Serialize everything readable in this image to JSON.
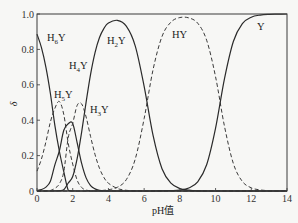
{
  "chart_data": {
    "type": "line",
    "title": "",
    "xlabel": "pH值",
    "ylabel": "δ",
    "xlim": [
      0,
      14
    ],
    "ylim": [
      0,
      1.0
    ],
    "grid": false,
    "legend": "inline labels on curves",
    "x_ticks": [
      "0",
      "2",
      "4",
      "6",
      "8",
      "10",
      "12",
      "14"
    ],
    "y_ticks": [
      "0",
      "0.2",
      "0.4",
      "0.6",
      "0.8",
      "1.0"
    ],
    "x": [
      0,
      0.25,
      0.5,
      0.75,
      1,
      1.25,
      1.5,
      1.75,
      2,
      2.25,
      2.5,
      2.75,
      3,
      3.25,
      3.5,
      3.75,
      4,
      4.5,
      5,
      5.5,
      6,
      6.5,
      7,
      7.5,
      8,
      8.5,
      9,
      9.5,
      10,
      10.5,
      11,
      11.5,
      12,
      12.5,
      13,
      13.5,
      14
    ],
    "series": [
      {
        "name": "H6Y",
        "label_main": "H",
        "label_sub": "6",
        "label_tail": "Y",
        "style": "solid",
        "label_pos": [
          47,
          41
        ],
        "values": [
          0.886,
          0.81,
          0.699,
          0.551,
          0.371,
          0.226,
          0.109,
          0.004,
          0.001,
          0,
          0,
          0,
          0,
          0,
          0,
          0,
          0,
          0,
          0,
          0,
          0,
          0,
          0,
          0,
          0,
          0,
          0,
          0,
          0,
          0,
          0,
          0,
          0,
          0,
          0,
          0,
          0
        ]
      },
      {
        "name": "H5Y",
        "label_main": "H",
        "label_sub": "5",
        "label_tail": "Y",
        "style": "dashed",
        "label_pos": [
          54,
          98
        ],
        "values": [
          0.112,
          0.181,
          0.278,
          0.39,
          0.467,
          0.506,
          0.432,
          0.269,
          0.152,
          0.061,
          0.02,
          0.005,
          0.002,
          0,
          0,
          0,
          0,
          0,
          0,
          0,
          0,
          0,
          0,
          0,
          0,
          0,
          0,
          0,
          0,
          0,
          0,
          0,
          0,
          0,
          0,
          0,
          0
        ]
      },
      {
        "name": "H4Y",
        "label_main": "H",
        "label_sub": "4",
        "label_tail": "Y",
        "style": "solid",
        "label_pos": [
          69,
          69
        ],
        "values": [
          0.003,
          0.008,
          0.022,
          0.055,
          0.148,
          0.226,
          0.343,
          0.38,
          0.382,
          0.272,
          0.156,
          0.074,
          0.031,
          0.012,
          0.004,
          0.001,
          0,
          0,
          0,
          0,
          0,
          0,
          0,
          0,
          0,
          0,
          0,
          0,
          0,
          0,
          0,
          0,
          0,
          0,
          0,
          0,
          0
        ]
      },
      {
        "name": "H3Y",
        "label_main": "H",
        "label_sub": "3",
        "label_tail": "Y",
        "style": "dashed",
        "label_pos": [
          90,
          113
        ],
        "values": [
          0,
          0,
          0.001,
          0.003,
          0.015,
          0.04,
          0.109,
          0.302,
          0.382,
          0.484,
          0.492,
          0.418,
          0.308,
          0.206,
          0.128,
          0.076,
          0.044,
          0.014,
          0.004,
          0.001,
          0,
          0,
          0,
          0,
          0,
          0,
          0,
          0,
          0,
          0,
          0,
          0,
          0,
          0,
          0,
          0,
          0
        ]
      },
      {
        "name": "H2Y",
        "label_main": "H",
        "label_sub": "2",
        "label_tail": "Y",
        "style": "solid",
        "label_pos": [
          107,
          44
        ],
        "values": [
          0,
          0,
          0,
          0,
          0.001,
          0.002,
          0.007,
          0.045,
          0.082,
          0.184,
          0.333,
          0.502,
          0.659,
          0.782,
          0.867,
          0.919,
          0.949,
          0.964,
          0.931,
          0.82,
          0.591,
          0.314,
          0.126,
          0.044,
          0.014,
          0.005,
          0.001,
          0,
          0,
          0,
          0,
          0,
          0,
          0,
          0,
          0,
          0
        ]
      },
      {
        "name": "HY",
        "label_main": "HY",
        "label_sub": "",
        "label_tail": "",
        "style": "dashed",
        "label_pos": [
          172,
          38
        ],
        "values": [
          0,
          0,
          0,
          0,
          0,
          0,
          0,
          0,
          0,
          0,
          0,
          0,
          0,
          0,
          0.001,
          0.004,
          0.007,
          0.021,
          0.064,
          0.18,
          0.409,
          0.686,
          0.873,
          0.954,
          0.98,
          0.978,
          0.948,
          0.852,
          0.645,
          0.365,
          0.154,
          0.054,
          0.018,
          0.006,
          0.002,
          0.001,
          0
        ]
      },
      {
        "name": "Y",
        "label_main": "Y",
        "label_sub": "",
        "label_tail": "",
        "style": "solid",
        "label_pos": [
          257,
          30
        ],
        "values": [
          0,
          0,
          0,
          0,
          0,
          0,
          0,
          0,
          0,
          0,
          0,
          0,
          0,
          0,
          0,
          0,
          0,
          0,
          0,
          0,
          0,
          0,
          0.001,
          0.002,
          0.005,
          0.017,
          0.052,
          0.148,
          0.355,
          0.635,
          0.846,
          0.946,
          0.982,
          0.994,
          0.998,
          0.999,
          1.0
        ]
      }
    ]
  },
  "plot_area": {
    "left": 37,
    "right": 287,
    "top": 14,
    "bottom": 191
  }
}
